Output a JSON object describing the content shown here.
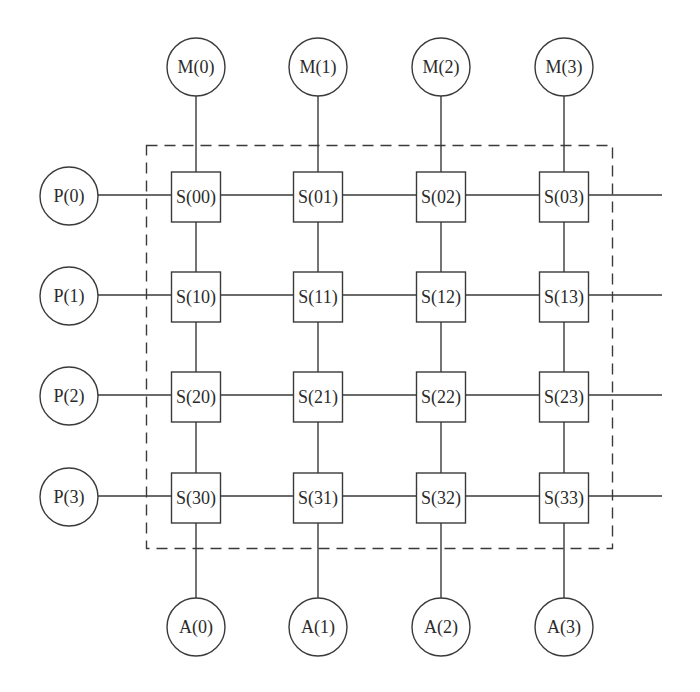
{
  "diagram": {
    "type": "crossbar-switch-network",
    "grid": {
      "rows": 4,
      "cols": 4
    },
    "memory_modules": [
      {
        "id": "M0",
        "label": "M(0)"
      },
      {
        "id": "M1",
        "label": "M(1)"
      },
      {
        "id": "M2",
        "label": "M(2)"
      },
      {
        "id": "M3",
        "label": "M(3)"
      }
    ],
    "processors": [
      {
        "id": "P0",
        "label": "P(0)"
      },
      {
        "id": "P1",
        "label": "P(1)"
      },
      {
        "id": "P2",
        "label": "P(2)"
      },
      {
        "id": "P3",
        "label": "P(3)"
      }
    ],
    "bottom_nodes": [
      {
        "id": "A0",
        "label": "A(0)"
      },
      {
        "id": "A1",
        "label": "A(1)"
      },
      {
        "id": "A2",
        "label": "A(2)"
      },
      {
        "id": "A3",
        "label": "A(3)"
      }
    ],
    "switches": [
      [
        "S(00)",
        "S(01)",
        "S(02)",
        "S(03)"
      ],
      [
        "S(10)",
        "S(11)",
        "S(12)",
        "S(13)"
      ],
      [
        "S(20)",
        "S(21)",
        "S(22)",
        "S(23)"
      ],
      [
        "S(30)",
        "S(31)",
        "S(32)",
        "S(33)"
      ]
    ],
    "boundary": {
      "style": "dashed",
      "encloses": "switch-grid"
    },
    "colors": {
      "stroke": "#3a3a3a",
      "text": "#2b2b2b",
      "background": "#ffffff"
    }
  }
}
